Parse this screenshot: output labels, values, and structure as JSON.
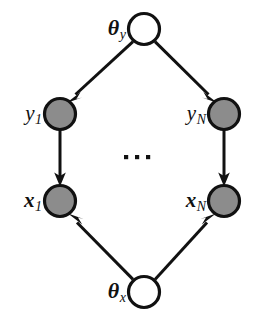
{
  "diagram": {
    "type": "directed-graphical-model",
    "colors": {
      "observed_fill": "#8c8c8c",
      "latent_fill": "#ffffff",
      "stroke": "#111111",
      "background": "#ffffff"
    },
    "ellipsis": {
      "symbol": "...",
      "dot_count": 3
    },
    "nodes": [
      {
        "id": "theta_y",
        "label_base": "θ",
        "label_sub": "y",
        "style": "latent",
        "cx": 144,
        "cy": 29,
        "r": 16,
        "label_x": 126,
        "label_y": 30
      },
      {
        "id": "y_1",
        "label_base": "y",
        "label_sub": "1",
        "style": "observed",
        "cx": 60,
        "cy": 114,
        "r": 16,
        "label_x": 42,
        "label_y": 115
      },
      {
        "id": "y_N",
        "label_base": "y",
        "label_sub": "N",
        "style": "observed",
        "cx": 224,
        "cy": 114,
        "r": 16,
        "label_x": 206,
        "label_y": 115
      },
      {
        "id": "x_1",
        "label_base": "x",
        "label_sub": "1",
        "style": "observed",
        "cx": 60,
        "cy": 201,
        "r": 16,
        "label_x": 42,
        "label_y": 202
      },
      {
        "id": "x_N",
        "label_base": "x",
        "label_sub": "N",
        "style": "observed",
        "cx": 224,
        "cy": 201,
        "r": 16,
        "label_x": 206,
        "label_y": 202
      },
      {
        "id": "theta_x",
        "label_base": "θ",
        "label_sub": "x",
        "style": "latent",
        "cx": 144,
        "cy": 292,
        "r": 16,
        "label_x": 126,
        "label_y": 293
      }
    ],
    "edges": [
      {
        "id": "theta_y-to-y_1",
        "from": "theta_y",
        "to": "y_1",
        "direction": "down-left"
      },
      {
        "id": "theta_y-to-y_N",
        "from": "theta_y",
        "to": "y_N",
        "direction": "down-right"
      },
      {
        "id": "y_1-to-x_1",
        "from": "y_1",
        "to": "x_1",
        "direction": "down"
      },
      {
        "id": "y_N-to-x_N",
        "from": "y_N",
        "to": "x_N",
        "direction": "down"
      },
      {
        "id": "theta_x-to-x_1",
        "from": "theta_x",
        "to": "x_1",
        "direction": "up-left"
      },
      {
        "id": "theta_x-to-x_N",
        "from": "theta_x",
        "to": "x_N",
        "direction": "up-right"
      }
    ]
  }
}
